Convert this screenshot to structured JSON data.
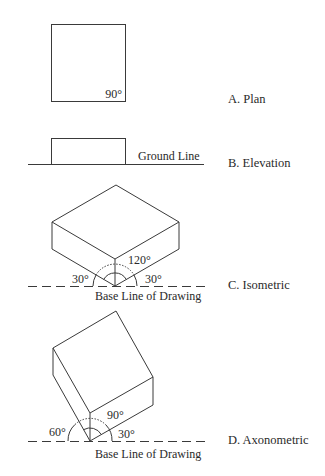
{
  "figure": {
    "views": [
      {
        "id": "A",
        "label": "A.  Plan",
        "angle_label": "90°"
      },
      {
        "id": "B",
        "label": "B.  Elevation",
        "line_label": "Ground Line"
      },
      {
        "id": "C",
        "label": "C.  Isometric",
        "angle_labels": {
          "left": "30°",
          "top": "120°",
          "right": "30°"
        },
        "base_label": "Base Line of Drawing"
      },
      {
        "id": "D",
        "label": "D.  Axonometric",
        "angle_labels": {
          "left": "60°",
          "top": "90°",
          "right": "30°"
        },
        "base_label": "Base Line of Drawing"
      }
    ]
  }
}
